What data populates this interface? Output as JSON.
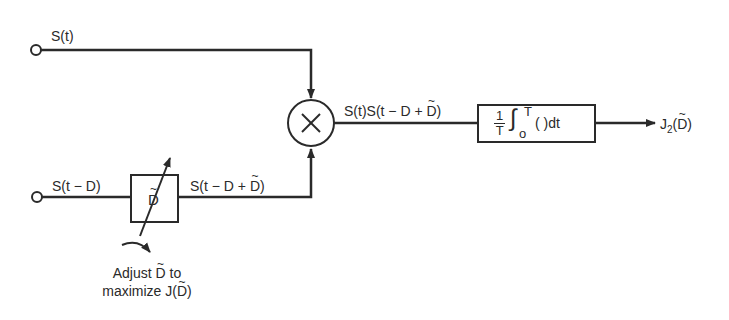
{
  "diagram": {
    "type": "block-diagram",
    "inputs": {
      "top": {
        "label": "S(t)"
      },
      "bottom": {
        "label": "S(t − D)"
      }
    },
    "delay_block": {
      "symbol": "D",
      "has_tilde": true
    },
    "delay_output_label_prefix": "S(t − D + ",
    "delay_output_label_suffix": ")",
    "multiplier": {
      "symbol": "×"
    },
    "product_label_prefix": "S(t)S(t − D + ",
    "product_label_suffix": ")",
    "integrator": {
      "numerator": "1",
      "denominator": "T",
      "integral_sign": "∫",
      "upper_limit": "T",
      "lower_limit": "o",
      "integrand": "(  )dt"
    },
    "output": {
      "prefix": "J",
      "subscript": "2",
      "arg_open": "(",
      "arg": "D",
      "arg_close": ")"
    },
    "adjust_note": {
      "line1_prefix": "Adjust ",
      "line1_symbol": "D",
      "line1_suffix": " to",
      "line2_prefix": "maximize J(",
      "line2_symbol": "D",
      "line2_suffix": ")"
    },
    "colors": {
      "ink": "#2a2a2a",
      "background": "#ffffff"
    }
  }
}
